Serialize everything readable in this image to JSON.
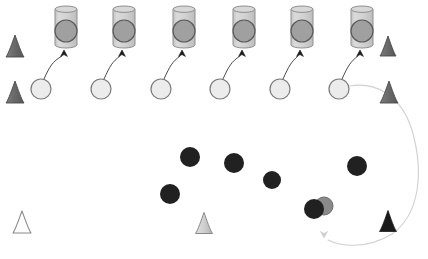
{
  "canvas": {
    "width": 428,
    "height": 259,
    "background": "#ffffff",
    "title": "Robot Swarm Simulation Scene"
  },
  "palette": {
    "cylinder_body": "#c9c9c9",
    "cylinder_body_light": "#dcdcdc",
    "cylinder_top": "#d7d7d7",
    "cylinder_outline": "#8f8f8f",
    "dark_circle_on_cylinder": "#a0a0a0",
    "dark_circle_on_cylinder_outline": "#5a5a5a",
    "light_circle_fill": "#ececec",
    "light_circle_outline": "#7a7a7a",
    "gray_triangle": "#6e6e6e",
    "gray_triangle_outline": "#4a4a4a",
    "light_gray_triangle": "#c8c8c8",
    "light_gray_triangle_outline": "#8a8a8a",
    "open_triangle_fill": "#ffffff",
    "open_triangle_outline": "#888888",
    "black_triangle": "#1a1a1a",
    "black_circle": "#212121",
    "gray_circle": "#8a8a8a",
    "gray_circle_outline": "#6b6b6b",
    "arrow_stroke": "#4a4a4a",
    "arrow_head": "#1a1a1a",
    "long_curve_stroke": "#d0d0d0",
    "long_curve_head": "#cfcfcf"
  },
  "cylinders": [
    {
      "id": "cylinder-1",
      "x": 55,
      "y": 6,
      "width": 22,
      "height": 42,
      "marker_cy": 25,
      "marker_r": 11
    },
    {
      "id": "cylinder-2",
      "x": 113,
      "y": 6,
      "width": 22,
      "height": 42,
      "marker_cy": 25,
      "marker_r": 11
    },
    {
      "id": "cylinder-3",
      "x": 173,
      "y": 6,
      "width": 22,
      "height": 42,
      "marker_cy": 25,
      "marker_r": 11
    },
    {
      "id": "cylinder-4",
      "x": 233,
      "y": 6,
      "width": 22,
      "height": 42,
      "marker_cy": 25,
      "marker_r": 11
    },
    {
      "id": "cylinder-5",
      "x": 291,
      "y": 6,
      "width": 22,
      "height": 42,
      "marker_cy": 25,
      "marker_r": 11
    },
    {
      "id": "cylinder-6",
      "x": 351,
      "y": 6,
      "width": 22,
      "height": 42,
      "marker_cy": 25,
      "marker_r": 11
    }
  ],
  "goal_arrowheads": [
    {
      "id": "goal-arrow-1",
      "x": 64,
      "y": 50
    },
    {
      "id": "goal-arrow-2",
      "x": 122,
      "y": 50
    },
    {
      "id": "goal-arrow-3",
      "x": 182,
      "y": 50
    },
    {
      "id": "goal-arrow-4",
      "x": 242,
      "y": 50
    },
    {
      "id": "goal-arrow-5",
      "x": 300,
      "y": 50
    },
    {
      "id": "goal-arrow-6",
      "x": 360,
      "y": 50
    }
  ],
  "light_circles": [
    {
      "id": "agent-1",
      "cx": 41,
      "cy": 89,
      "r": 10
    },
    {
      "id": "agent-2",
      "cx": 101,
      "cy": 89,
      "r": 10
    },
    {
      "id": "agent-3",
      "cx": 161,
      "cy": 89,
      "r": 10
    },
    {
      "id": "agent-4",
      "cx": 220,
      "cy": 89,
      "r": 10
    },
    {
      "id": "agent-5",
      "cx": 280,
      "cy": 89,
      "r": 10
    },
    {
      "id": "agent-6",
      "cx": 339,
      "cy": 89,
      "r": 10
    }
  ],
  "curved_arrows": [
    {
      "id": "path-1",
      "d": "M 44 79 C 50 66, 52 62, 62 56"
    },
    {
      "id": "path-2",
      "d": "M 104 79 C 110 66, 112 62, 120 56"
    },
    {
      "id": "path-3",
      "d": "M 164 79 C 170 66, 172 62, 180 56"
    },
    {
      "id": "path-4",
      "d": "M 223 79 C 229 66, 231 62, 240 56"
    },
    {
      "id": "path-5",
      "d": "M 283 79 C 289 66, 291 62, 298 56"
    },
    {
      "id": "path-6",
      "d": "M 342 79 C 348 66, 350 62, 358 56"
    }
  ],
  "long_curve": {
    "id": "return-path",
    "d": "M 350 86 C 372 82, 400 92, 412 130 C 424 172, 420 214, 392 234 C 366 250, 340 246, 328 240",
    "arrowhead_x": 324,
    "arrowhead_y": 238
  },
  "gray_triangles": [
    {
      "id": "gray-triangle-left-top",
      "cx": 15,
      "cy": 46,
      "w": 18,
      "h": 22
    },
    {
      "id": "gray-triangle-left-bottom",
      "cx": 15,
      "cy": 92,
      "w": 18,
      "h": 22
    },
    {
      "id": "gray-triangle-right-top",
      "cx": 388,
      "cy": 46,
      "w": 16,
      "h": 20
    },
    {
      "id": "gray-triangle-right-bottom",
      "cx": 389,
      "cy": 92,
      "w": 18,
      "h": 22
    }
  ],
  "black_circles": [
    {
      "id": "obstacle-1",
      "cx": 190,
      "cy": 157,
      "r": 10
    },
    {
      "id": "obstacle-2",
      "cx": 234,
      "cy": 163,
      "r": 10
    },
    {
      "id": "obstacle-3",
      "cx": 272,
      "cy": 180,
      "r": 9
    },
    {
      "id": "obstacle-4",
      "cx": 357,
      "cy": 166,
      "r": 10
    },
    {
      "id": "obstacle-5",
      "cx": 170,
      "cy": 194,
      "r": 10
    },
    {
      "id": "obstacle-6",
      "cx": 314,
      "cy": 209,
      "r": 10
    }
  ],
  "overlap_gray_circle": {
    "id": "occluded-marker",
    "cx": 324,
    "cy": 206,
    "r": 9
  },
  "bottom_triangles": [
    {
      "id": "open-triangle-bottom-left",
      "cx": 22,
      "cy": 222,
      "w": 18,
      "h": 22,
      "style": "open"
    },
    {
      "id": "light-triangle-bottom-mid",
      "cx": 204,
      "cy": 223,
      "w": 17,
      "h": 21,
      "style": "light"
    },
    {
      "id": "black-triangle-bottom-right",
      "cx": 388,
      "cy": 221,
      "w": 17,
      "h": 21,
      "style": "black"
    }
  ]
}
